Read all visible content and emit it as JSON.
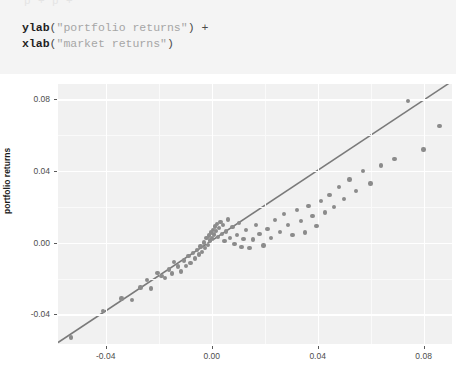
{
  "code": {
    "ghost_line": "p + p +",
    "lines": [
      {
        "fn": "ylab",
        "open": "(",
        "str": "\"portfolio returns\"",
        "close": ")",
        "tail": " +"
      },
      {
        "fn": "xlab",
        "open": "(",
        "str": "\"market returns\"",
        "close": ")",
        "tail": ""
      }
    ]
  },
  "colors": {
    "panel_bg": "#f1f1f1",
    "gridline": "#ffffff",
    "point": "#8b8b8b",
    "fit_line": "#7a7a7a",
    "code_bg": "#f4f4f4",
    "axis_text": "#4d4d4d"
  },
  "chart_data": {
    "type": "scatter",
    "title": "",
    "xlabel": "market returns",
    "ylabel": "portfolio returns",
    "xlim": [
      -0.058,
      0.0907
    ],
    "ylim": [
      -0.0565,
      0.0886
    ],
    "xticks": [
      -0.04,
      0.0,
      0.04,
      0.08
    ],
    "xticklabels": [
      "-0.04",
      "0.00",
      "0.04",
      "0.08"
    ],
    "yticks": [
      -0.04,
      0.0,
      0.04,
      0.08
    ],
    "yticklabels": [
      "-0.04",
      "0.00",
      "0.04",
      "0.08"
    ],
    "grid": true,
    "grid_minor": true,
    "legend": null,
    "fit_line": {
      "type": "linear",
      "slope": 0.98,
      "intercept": 0.0012,
      "x_start": -0.058,
      "x_end": 0.0895,
      "color": "#7a7a7a"
    },
    "series": [
      {
        "name": "returns",
        "marker": "circle",
        "color": "#8b8b8b",
        "points": [
          [
            -0.053,
            -0.0528
          ],
          [
            -0.041,
            -0.038
          ],
          [
            -0.034,
            -0.031
          ],
          [
            -0.03,
            -0.0318
          ],
          [
            -0.0268,
            -0.025
          ],
          [
            -0.0245,
            -0.0208
          ],
          [
            -0.0228,
            -0.0255
          ],
          [
            -0.0205,
            -0.0168
          ],
          [
            -0.019,
            -0.0185
          ],
          [
            -0.0176,
            -0.0196
          ],
          [
            -0.0162,
            -0.015
          ],
          [
            -0.015,
            -0.0172
          ],
          [
            -0.0142,
            -0.0108
          ],
          [
            -0.0128,
            -0.0132
          ],
          [
            -0.0116,
            -0.016
          ],
          [
            -0.0104,
            -0.0098
          ],
          [
            -0.0096,
            -0.0128
          ],
          [
            -0.0088,
            -0.0074
          ],
          [
            -0.008,
            -0.0112
          ],
          [
            -0.007,
            -0.0058
          ],
          [
            -0.0062,
            -0.0088
          ],
          [
            -0.0055,
            -0.004
          ],
          [
            -0.0048,
            -0.0065
          ],
          [
            -0.0042,
            -0.002
          ],
          [
            -0.0036,
            -0.0052
          ],
          [
            -0.003,
            0.0002
          ],
          [
            -0.0026,
            -0.003
          ],
          [
            -0.002,
            0.0028
          ],
          [
            -0.0015,
            -0.0012
          ],
          [
            -0.001,
            0.004
          ],
          [
            -0.0006,
            0.0012
          ],
          [
            -0.0002,
            0.0058
          ],
          [
            0.0001,
            0.0024
          ],
          [
            0.0004,
            0.0072
          ],
          [
            0.0008,
            0.0046
          ],
          [
            0.0012,
            0.009
          ],
          [
            0.0016,
            0.0064
          ],
          [
            0.002,
            0.0104
          ],
          [
            0.0024,
            0.0032
          ],
          [
            0.0028,
            0.0082
          ],
          [
            0.0033,
            0.0116
          ],
          [
            0.0038,
            0.0048
          ],
          [
            0.0043,
            0.0098
          ],
          [
            0.0048,
            0.001
          ],
          [
            0.0055,
            0.0062
          ],
          [
            0.0062,
            0.013
          ],
          [
            0.007,
            0.0026
          ],
          [
            0.0078,
            0.0088
          ],
          [
            0.0086,
            -0.0008
          ],
          [
            0.0095,
            0.0044
          ],
          [
            0.0104,
            0.0112
          ],
          [
            0.0112,
            -0.0022
          ],
          [
            0.012,
            0.002
          ],
          [
            0.013,
            0.007
          ],
          [
            0.0142,
            -0.003
          ],
          [
            0.0155,
            0.0018
          ],
          [
            0.0168,
            0.0098
          ],
          [
            0.018,
            0.0048
          ],
          [
            0.0195,
            -0.0016
          ],
          [
            0.021,
            0.0076
          ],
          [
            0.0225,
            0.0028
          ],
          [
            0.024,
            0.0128
          ],
          [
            0.0258,
            0.006
          ],
          [
            0.0272,
            0.016
          ],
          [
            0.0288,
            0.01
          ],
          [
            0.0305,
            0.0042
          ],
          [
            0.0322,
            0.0182
          ],
          [
            0.0338,
            0.012
          ],
          [
            0.0352,
            0.0058
          ],
          [
            0.0366,
            0.0205
          ],
          [
            0.038,
            0.0148
          ],
          [
            0.0395,
            0.0092
          ],
          [
            0.0412,
            0.0232
          ],
          [
            0.0428,
            0.017
          ],
          [
            0.0445,
            0.0268
          ],
          [
            0.0462,
            0.0198
          ],
          [
            0.048,
            0.031
          ],
          [
            0.05,
            0.0245
          ],
          [
            0.052,
            0.0352
          ],
          [
            0.0545,
            0.0288
          ],
          [
            0.057,
            0.04
          ],
          [
            0.06,
            0.033
          ],
          [
            0.064,
            0.0432
          ],
          [
            0.069,
            0.0468
          ],
          [
            0.074,
            0.079
          ],
          [
            0.08,
            0.052
          ],
          [
            0.086,
            0.065
          ]
        ]
      }
    ]
  }
}
